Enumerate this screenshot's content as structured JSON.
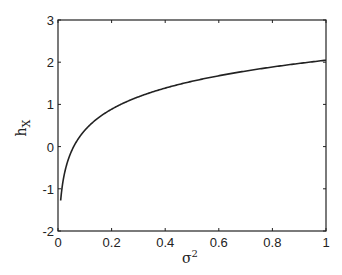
{
  "chart_data": {
    "type": "line",
    "title": "",
    "xlabel": "σ²",
    "ylabel": "h_X",
    "xlim": [
      0,
      1
    ],
    "ylim": [
      -2,
      3
    ],
    "grid": false,
    "legend": null,
    "xticks": [
      0,
      0.2,
      0.4,
      0.6,
      0.8,
      1
    ],
    "xtick_labels": [
      "0",
      "0.2",
      "0.4",
      "0.6",
      "0.8",
      "1"
    ],
    "yticks": [
      -2,
      -1,
      0,
      1,
      2,
      3
    ],
    "ytick_labels": [
      "-2",
      "-1",
      "0",
      "1",
      "2",
      "3"
    ],
    "series": [
      {
        "name": "h_X",
        "function": "0.5*log2(2*pi*e*sigma^2)",
        "x": [
          0.01,
          0.02,
          0.03,
          0.05,
          0.075,
          0.1,
          0.15,
          0.2,
          0.3,
          0.4,
          0.5,
          0.6,
          0.7,
          0.8,
          0.9,
          1.0
        ],
        "y": [
          -1.27,
          -0.77,
          -0.47,
          -0.1,
          0.19,
          0.39,
          0.69,
          0.9,
          1.19,
          1.39,
          1.55,
          1.68,
          1.79,
          1.89,
          1.98,
          2.05
        ]
      }
    ],
    "color": "#222222"
  },
  "axes": {
    "xlabel_base": "σ",
    "xlabel_sup": "2",
    "ylabel_base": "h",
    "ylabel_sub": "X"
  }
}
